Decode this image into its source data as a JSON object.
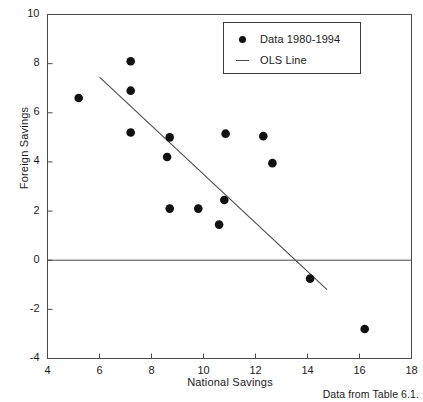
{
  "chart_data": {
    "type": "scatter",
    "title": "",
    "xlabel": "National Savings",
    "ylabel": "Foreign Savings",
    "xlim": [
      4,
      18
    ],
    "ylim": [
      -4,
      10
    ],
    "xticks": [
      4,
      6,
      8,
      10,
      12,
      14,
      16,
      18
    ],
    "yticks": [
      -4,
      -2,
      0,
      2,
      4,
      6,
      8,
      10
    ],
    "xtick_labels": [
      "4",
      "6",
      "8",
      "10",
      "12",
      "14",
      "16",
      "18"
    ],
    "ytick_labels": [
      "-4",
      "-2",
      "0",
      "2",
      "4",
      "6",
      "8",
      "10"
    ],
    "grid": false,
    "zero_line": true,
    "legend_position": "top-right",
    "series": [
      {
        "name": "Data 1980-1994",
        "type": "scatter",
        "marker": "filled-circle",
        "color": "#111111",
        "points": [
          [
            5.2,
            6.6
          ],
          [
            7.2,
            8.1
          ],
          [
            7.2,
            6.9
          ],
          [
            7.2,
            5.2
          ],
          [
            8.6,
            4.2
          ],
          [
            8.7,
            5.0
          ],
          [
            8.7,
            2.1
          ],
          [
            9.8,
            2.1
          ],
          [
            10.6,
            1.45
          ],
          [
            10.8,
            2.45
          ],
          [
            10.85,
            5.15
          ],
          [
            12.3,
            5.05
          ],
          [
            12.65,
            3.95
          ],
          [
            14.1,
            -0.75
          ],
          [
            16.2,
            -2.8
          ]
        ]
      },
      {
        "name": "OLS Line",
        "type": "line",
        "color": "#4a4a4a",
        "endpoints": [
          [
            6.0,
            7.45
          ],
          [
            14.75,
            -1.2
          ]
        ]
      }
    ],
    "annotations": [
      {
        "name": "source-note",
        "text": "Data from Table 6.1.",
        "position": "bottom-right"
      }
    ]
  },
  "legend": {
    "entries": [
      {
        "label": "Data 1980-1994",
        "marker": "filled-circle"
      },
      {
        "label": "OLS Line",
        "marker": "line-segment"
      }
    ]
  },
  "axes": {
    "x_title": "National Savings",
    "y_title": "Foreign Savings"
  },
  "footer": {
    "source": "Data from Table 6.1."
  }
}
